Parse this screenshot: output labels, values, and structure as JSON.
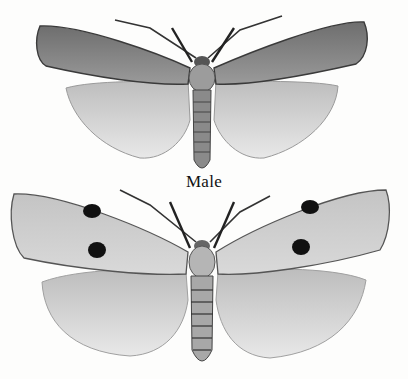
{
  "plate": {
    "caption": "Male",
    "figures": [
      {
        "id": "upper-moth",
        "forewing": "dark grey, unspotted",
        "hindwing": "pale grey with veins"
      },
      {
        "id": "lower-moth",
        "forewing": "pale grey with two black spots each",
        "hindwing": "pale grey with veins"
      }
    ],
    "colors": {
      "background": "#fdfdfc",
      "ink": "#111111",
      "dark_wing": "#7d7d7d",
      "pale_wing": "#cfcfcf",
      "hind_wing": "#dcdcdc"
    }
  }
}
